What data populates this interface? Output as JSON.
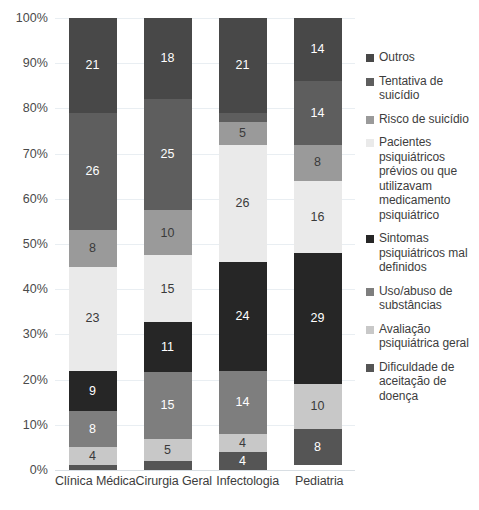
{
  "chart_data": {
    "type": "bar",
    "subtype": "stacked-percentage-bar",
    "title": "",
    "xlabel": "",
    "ylabel": "",
    "ylim": [
      0,
      100
    ],
    "grid": true,
    "legend_position": "right",
    "categories": [
      "Clínica Médica",
      "Cirurgia Geral",
      "Infectologia",
      "Pediatria"
    ],
    "y_ticks": [
      "0%",
      "10%",
      "20%",
      "30%",
      "40%",
      "50%",
      "60%",
      "70%",
      "80%",
      "90%",
      "100%"
    ],
    "y_tick_values": [
      0,
      10,
      20,
      30,
      40,
      50,
      60,
      70,
      80,
      90,
      100
    ],
    "stack_order_top_to_bottom": [
      "Outros",
      "Tentativa de suicídio",
      "Risco de suicídio",
      "Pacientes psiquiátricos prévios ou que utilizavam medicamento psiquiátrico",
      "Sintomas psiquiátricos mal definidos",
      "Uso/abuso de substâncias",
      "Avaliação psiquiátrica geral",
      "Dificuldade de aceitação de doença"
    ],
    "series": [
      {
        "name": "Outros",
        "color": "#484848",
        "values": [
          21,
          18,
          21,
          14
        ]
      },
      {
        "name": "Tentativa de suicídio",
        "color": "#5e5e5e",
        "values": [
          26,
          25,
          2,
          14
        ]
      },
      {
        "name": "Risco de suicídio",
        "color": "#9a9a9a",
        "values": [
          8,
          10,
          5,
          8
        ]
      },
      {
        "name": "Pacientes psiquiátricos prévios",
        "color": "#eaeaea",
        "values": [
          23,
          15,
          26,
          16
        ]
      },
      {
        "name": "Sintomas psiquiátricos mal definidos",
        "color": "#262626",
        "values": [
          9,
          11,
          24,
          29
        ]
      },
      {
        "name": "Uso/abuso de substâncias",
        "color": "#7e7e7e",
        "values": [
          8,
          15,
          14,
          0
        ]
      },
      {
        "name": "Avaliação psiquiátrica geral",
        "color": "#c8c8c8",
        "values": [
          4,
          5,
          4,
          10
        ]
      },
      {
        "name": "Dificuldade de aceitação de doença",
        "color": "#555555",
        "values": [
          1,
          2,
          4,
          8
        ]
      }
    ]
  },
  "legend": {
    "items": [
      {
        "label": "Outros",
        "color": "#484848"
      },
      {
        "label": "Tentativa de suicídio",
        "color": "#5e5e5e"
      },
      {
        "label": "Risco de suicídio",
        "color": "#9a9a9a"
      },
      {
        "label": "Pacientes psiquiátricos prévios ou que utilizavam medicamento psiquiátrico",
        "color": "#eaeaea"
      },
      {
        "label": "Sintomas psiquiátricos mal definidos",
        "color": "#262626"
      },
      {
        "label": "Uso/abuso de substâncias",
        "color": "#7e7e7e"
      },
      {
        "label": "Avaliação psiquiátrica geral",
        "color": "#c8c8c8"
      },
      {
        "label": "Dificuldade de aceitação de doença",
        "color": "#555555"
      }
    ]
  }
}
